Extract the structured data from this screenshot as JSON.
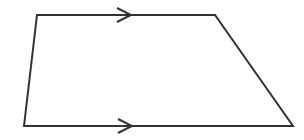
{
  "diagram": {
    "type": "trapezoid",
    "stroke_color": "#333333",
    "stroke_width": 2,
    "background": "#ffffff",
    "vertices": [
      {
        "name": "top-left",
        "x": 37,
        "y": 15
      },
      {
        "name": "top-right",
        "x": 215,
        "y": 15
      },
      {
        "name": "bottom-right",
        "x": 293,
        "y": 126
      },
      {
        "name": "bottom-left",
        "x": 24,
        "y": 126
      }
    ],
    "parallel_marks": [
      {
        "side": "top",
        "tip_x": 131,
        "y": 15,
        "size": 7
      },
      {
        "side": "bottom",
        "tip_x": 132,
        "y": 126,
        "size": 7
      }
    ]
  }
}
